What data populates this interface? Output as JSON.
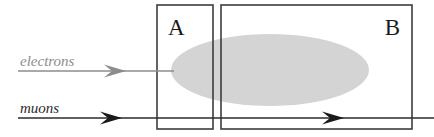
{
  "diagram": {
    "canvas": {
      "width": 434,
      "height": 137,
      "background": "#ffffff"
    },
    "regions": [
      {
        "key": "A",
        "label": "A",
        "label_position": "top-left",
        "x": 157,
        "y": 5,
        "width": 56,
        "height": 124,
        "stroke": "#3d3d3d",
        "fill": "none",
        "label_x": 168,
        "label_y": 35,
        "label_size": 23
      },
      {
        "key": "B",
        "label": "B",
        "label_position": "top-right",
        "x": 221,
        "y": 5,
        "width": 191,
        "height": 124,
        "stroke": "#3d3d3d",
        "fill": "none",
        "label_x": 400,
        "label_y": 35,
        "label_size": 23
      }
    ],
    "shower_ellipse": {
      "name": "shower-ellipse",
      "cx": 270,
      "cy": 70,
      "rx": 99,
      "ry": 36,
      "fill": "#d4d4d4"
    },
    "beams": [
      {
        "key": "electrons",
        "label": "electrons",
        "color": "#8c8c8c",
        "label_x": 20,
        "label_y": 66,
        "label_size": 15,
        "line_y": 71,
        "line_x1": 18,
        "line_x2": 174,
        "arrowheads": [
          {
            "x": 122,
            "y": 71
          }
        ],
        "stops_at_shower": true
      },
      {
        "key": "muons",
        "label": "muons",
        "color": "#2b2b2b",
        "label_x": 20,
        "label_y": 113,
        "label_size": 15,
        "line_y": 118,
        "line_x1": 18,
        "line_x2": 434,
        "arrowheads": [
          {
            "x": 118,
            "y": 118
          },
          {
            "x": 340,
            "y": 118
          }
        ],
        "stops_at_shower": false
      }
    ]
  }
}
